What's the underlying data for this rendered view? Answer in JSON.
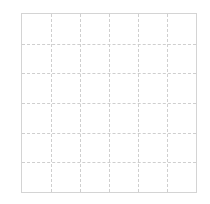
{
  "chart_data": {
    "type": "scatter",
    "title": "",
    "xlabel": "",
    "ylabel": "",
    "categories": [],
    "series": [],
    "grid": true,
    "grid_columns": 6,
    "grid_rows": 6,
    "x_tick_labels": [],
    "y_tick_labels": [],
    "legend": [],
    "colors": {
      "background": "#ffffff",
      "grid": "#cfcfcf",
      "border": "#d4d4d4"
    }
  }
}
